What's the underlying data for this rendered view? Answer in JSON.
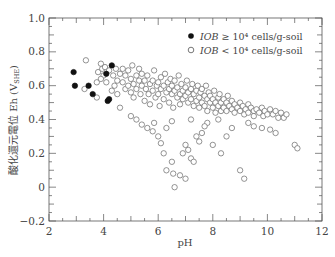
{
  "chart_data": {
    "type": "scatter",
    "title": "",
    "xlabel": "pH",
    "ylabel": "酸化還元電位 Eh (V_SHE)",
    "ylabel_main": "酸化還元電位 Eh (V",
    "ylabel_sub": "SHE",
    "ylabel_close": ")",
    "xlim": [
      2,
      12
    ],
    "ylim": [
      -0.2,
      1.0
    ],
    "xticks": [
      2,
      4,
      6,
      8,
      10,
      12
    ],
    "xtick_labels": [
      "2",
      "4",
      "6",
      "8",
      "10",
      "12"
    ],
    "yticks": [
      -0.2,
      0,
      0.2,
      0.4,
      0.6,
      0.8,
      1.0
    ],
    "ytick_labels": [
      "−0.2",
      "0",
      "0.2",
      "0.4",
      "0.6",
      "0.8",
      "1.0"
    ],
    "grid": false,
    "legend_position": "upper right",
    "legend": [
      {
        "marker": "filled-circle",
        "label_italic": "IOB",
        "label_rest": " ≥ 10⁴ cells/g-soil"
      },
      {
        "marker": "open-circle",
        "label_italic": "IOB",
        "label_rest": " < 10⁴ cells/g-soil"
      }
    ],
    "series": [
      {
        "name": "IOB ≥ 10⁴ cells/g-soil",
        "marker": "filled-circle",
        "color": "#111111",
        "points": [
          [
            2.9,
            0.68
          ],
          [
            2.95,
            0.6
          ],
          [
            3.45,
            0.6
          ],
          [
            3.6,
            0.55
          ],
          [
            4.1,
            0.67
          ],
          [
            4.3,
            0.72
          ],
          [
            4.15,
            0.51
          ],
          [
            4.2,
            0.52
          ]
        ]
      },
      {
        "name": "IOB < 10⁴ cells/g-soil",
        "marker": "open-circle",
        "color": "#555555",
        "points": [
          [
            3.35,
            0.75
          ],
          [
            3.3,
            0.58
          ],
          [
            3.75,
            0.53
          ],
          [
            3.75,
            0.62
          ],
          [
            3.8,
            0.68
          ],
          [
            3.9,
            0.73
          ],
          [
            3.95,
            0.7
          ],
          [
            4.0,
            0.66
          ],
          [
            4.05,
            0.71
          ],
          [
            3.9,
            0.64
          ],
          [
            4.1,
            0.62
          ],
          [
            4.2,
            0.69
          ],
          [
            4.35,
            0.66
          ],
          [
            4.4,
            0.6
          ],
          [
            4.45,
            0.7
          ],
          [
            4.5,
            0.63
          ],
          [
            4.3,
            0.57
          ],
          [
            4.5,
            0.55
          ],
          [
            4.6,
            0.67
          ],
          [
            4.6,
            0.47
          ],
          [
            4.7,
            0.62
          ],
          [
            4.7,
            0.7
          ],
          [
            4.8,
            0.58
          ],
          [
            4.8,
            0.66
          ],
          [
            4.9,
            0.6
          ],
          [
            4.9,
            0.69
          ],
          [
            5.0,
            0.64
          ],
          [
            5.0,
            0.56
          ],
          [
            5.05,
            0.72
          ],
          [
            5.1,
            0.61
          ],
          [
            5.1,
            0.53
          ],
          [
            5.2,
            0.66
          ],
          [
            5.2,
            0.58
          ],
          [
            5.3,
            0.63
          ],
          [
            5.3,
            0.7
          ],
          [
            5.35,
            0.55
          ],
          [
            5.4,
            0.6
          ],
          [
            5.4,
            0.67
          ],
          [
            5.5,
            0.63
          ],
          [
            5.5,
            0.51
          ],
          [
            5.55,
            0.58
          ],
          [
            5.6,
            0.66
          ],
          [
            5.65,
            0.55
          ],
          [
            5.7,
            0.61
          ],
          [
            5.7,
            0.49
          ],
          [
            5.8,
            0.63
          ],
          [
            5.8,
            0.57
          ],
          [
            5.85,
            0.69
          ],
          [
            5.9,
            0.53
          ],
          [
            5.95,
            0.6
          ],
          [
            6.0,
            0.62
          ],
          [
            6.0,
            0.55
          ],
          [
            6.05,
            0.48
          ],
          [
            6.1,
            0.58
          ],
          [
            6.1,
            0.65
          ],
          [
            6.2,
            0.6
          ],
          [
            6.2,
            0.52
          ],
          [
            6.25,
            0.67
          ],
          [
            6.3,
            0.56
          ],
          [
            6.35,
            0.62
          ],
          [
            6.4,
            0.58
          ],
          [
            6.4,
            0.5
          ],
          [
            6.45,
            0.64
          ],
          [
            6.5,
            0.55
          ],
          [
            6.5,
            0.6
          ],
          [
            6.55,
            0.47
          ],
          [
            6.6,
            0.57
          ],
          [
            6.6,
            0.63
          ],
          [
            6.7,
            0.53
          ],
          [
            6.7,
            0.59
          ],
          [
            6.75,
            0.66
          ],
          [
            6.8,
            0.55
          ],
          [
            6.8,
            0.49
          ],
          [
            6.85,
            0.61
          ],
          [
            6.9,
            0.57
          ],
          [
            6.9,
            0.52
          ],
          [
            7.0,
            0.59
          ],
          [
            7.0,
            0.54
          ],
          [
            7.05,
            0.63
          ],
          [
            7.1,
            0.5
          ],
          [
            7.1,
            0.56
          ],
          [
            7.2,
            0.58
          ],
          [
            7.2,
            0.52
          ],
          [
            7.25,
            0.61
          ],
          [
            7.3,
            0.55
          ],
          [
            7.3,
            0.48
          ],
          [
            7.4,
            0.57
          ],
          [
            7.4,
            0.51
          ],
          [
            7.45,
            0.6
          ],
          [
            7.5,
            0.53
          ],
          [
            7.5,
            0.47
          ],
          [
            7.55,
            0.56
          ],
          [
            7.6,
            0.5
          ],
          [
            7.6,
            0.58
          ],
          [
            7.7,
            0.54
          ],
          [
            7.7,
            0.48
          ],
          [
            7.75,
            0.6
          ],
          [
            7.8,
            0.52
          ],
          [
            7.8,
            0.45
          ],
          [
            7.85,
            0.56
          ],
          [
            7.9,
            0.5
          ],
          [
            7.9,
            0.54
          ],
          [
            8.0,
            0.52
          ],
          [
            8.0,
            0.47
          ],
          [
            8.05,
            0.57
          ],
          [
            8.1,
            0.5
          ],
          [
            8.1,
            0.44
          ],
          [
            8.2,
            0.53
          ],
          [
            8.2,
            0.48
          ],
          [
            8.25,
            0.55
          ],
          [
            8.3,
            0.5
          ],
          [
            8.3,
            0.45
          ],
          [
            8.4,
            0.52
          ],
          [
            8.4,
            0.47
          ],
          [
            8.5,
            0.5
          ],
          [
            8.5,
            0.45
          ],
          [
            8.55,
            0.54
          ],
          [
            8.6,
            0.48
          ],
          [
            8.7,
            0.51
          ],
          [
            8.7,
            0.46
          ],
          [
            8.8,
            0.49
          ],
          [
            8.8,
            0.44
          ],
          [
            8.9,
            0.47
          ],
          [
            9.0,
            0.5
          ],
          [
            9.0,
            0.45
          ],
          [
            9.1,
            0.48
          ],
          [
            9.15,
            0.43
          ],
          [
            9.2,
            0.46
          ],
          [
            9.3,
            0.49
          ],
          [
            9.3,
            0.44
          ],
          [
            9.4,
            0.47
          ],
          [
            9.5,
            0.45
          ],
          [
            9.5,
            0.42
          ],
          [
            9.6,
            0.46
          ],
          [
            9.7,
            0.44
          ],
          [
            9.8,
            0.47
          ],
          [
            9.85,
            0.42
          ],
          [
            9.9,
            0.45
          ],
          [
            10.0,
            0.43
          ],
          [
            10.1,
            0.46
          ],
          [
            10.2,
            0.43
          ],
          [
            10.3,
            0.45
          ],
          [
            10.4,
            0.41
          ],
          [
            10.5,
            0.44
          ],
          [
            10.6,
            0.41
          ],
          [
            10.7,
            0.43
          ],
          [
            11.0,
            0.25
          ],
          [
            11.1,
            0.23
          ],
          [
            5.0,
            0.42
          ],
          [
            5.2,
            0.4
          ],
          [
            5.4,
            0.37
          ],
          [
            5.6,
            0.35
          ],
          [
            5.8,
            0.33
          ],
          [
            6.0,
            0.3
          ],
          [
            6.1,
            0.26
          ],
          [
            5.85,
            0.38
          ],
          [
            6.3,
            0.35
          ],
          [
            6.5,
            0.39
          ],
          [
            6.2,
            0.2
          ],
          [
            6.3,
            0.1
          ],
          [
            6.5,
            0.15
          ],
          [
            6.55,
            0.08
          ],
          [
            6.6,
            0.0
          ],
          [
            6.8,
            0.07
          ],
          [
            7.0,
            0.05
          ],
          [
            6.9,
            0.2
          ],
          [
            7.0,
            0.25
          ],
          [
            7.1,
            0.22
          ],
          [
            7.2,
            0.17
          ],
          [
            7.3,
            0.15
          ],
          [
            7.4,
            0.3
          ],
          [
            7.5,
            0.27
          ],
          [
            7.6,
            0.32
          ],
          [
            7.8,
            0.38
          ],
          [
            8.0,
            0.25
          ],
          [
            8.3,
            0.2
          ],
          [
            8.5,
            0.3
          ],
          [
            8.7,
            0.35
          ],
          [
            9.0,
            0.1
          ],
          [
            9.15,
            0.05
          ],
          [
            9.3,
            0.38
          ],
          [
            9.5,
            0.36
          ],
          [
            9.8,
            0.35
          ],
          [
            10.1,
            0.34
          ],
          [
            10.3,
            0.32
          ],
          [
            7.2,
            0.4
          ],
          [
            7.7,
            0.36
          ],
          [
            8.2,
            0.4
          ]
        ]
      }
    ]
  },
  "colors": {
    "axis": "#555555",
    "filled_marker": "#111111",
    "open_marker": "#666666"
  }
}
